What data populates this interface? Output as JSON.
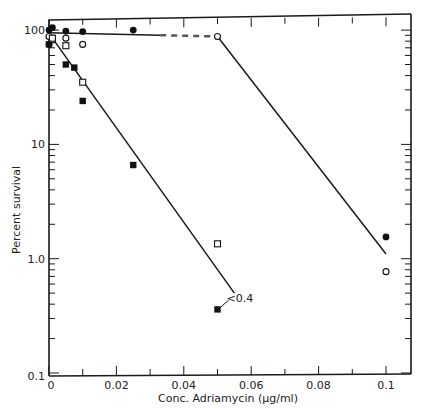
{
  "chart_data": {
    "type": "scatter",
    "title": "",
    "xlabel": "Conc. Adriamycin (μg/ml)",
    "ylabel": "Percent survival",
    "xlim": [
      0,
      0.105
    ],
    "ylim": [
      0.1,
      120
    ],
    "yscale": "log",
    "x_ticks": [
      0,
      0.02,
      0.04,
      0.06,
      0.08,
      0.1
    ],
    "x_tick_labels": [
      "0",
      "0.02",
      "0.04",
      "0.06",
      "0.08",
      "0.1"
    ],
    "y_ticks": [
      0.1,
      1.0,
      10,
      100
    ],
    "y_tick_labels": [
      "0.1",
      "1.0",
      "10",
      "100"
    ],
    "grid": false,
    "legend": null,
    "annotations": [
      {
        "text": "<0.4",
        "x": 0.05,
        "y": 0.36
      }
    ],
    "series": [
      {
        "name": "filled circles",
        "marker": "filled-circle",
        "points": [
          [
            0,
            100
          ],
          [
            0,
            75
          ],
          [
            0.001,
            105
          ],
          [
            0.005,
            98
          ],
          [
            0.01,
            97
          ],
          [
            0.025,
            100
          ],
          [
            0.1,
            1.55
          ]
        ]
      },
      {
        "name": "open circles",
        "marker": "open-circle",
        "points": [
          [
            0,
            88
          ],
          [
            0.001,
            82
          ],
          [
            0.005,
            85
          ],
          [
            0.01,
            75
          ],
          [
            0.05,
            88
          ],
          [
            0.1,
            0.77
          ]
        ]
      },
      {
        "name": "filled squares",
        "marker": "filled-square",
        "points": [
          [
            0,
            75
          ],
          [
            0.005,
            50
          ],
          [
            0.0075,
            47
          ],
          [
            0.01,
            24
          ],
          [
            0.025,
            6.6
          ],
          [
            0.05,
            0.36
          ]
        ]
      },
      {
        "name": "open squares",
        "marker": "open-square",
        "points": [
          [
            0.001,
            85
          ],
          [
            0.005,
            73
          ],
          [
            0.01,
            35
          ],
          [
            0.05,
            1.35
          ]
        ]
      }
    ],
    "fit_lines": [
      {
        "name": "circles plateau",
        "points": [
          [
            0,
            95
          ],
          [
            0.05,
            88
          ]
        ],
        "style": "solid-then-dashed"
      },
      {
        "name": "circles decline",
        "points": [
          [
            0.05,
            88
          ],
          [
            0.1,
            1.1
          ]
        ],
        "style": "solid"
      },
      {
        "name": "squares decline",
        "points": [
          [
            0.001,
            85
          ],
          [
            0.055,
            0.5
          ]
        ],
        "style": "solid"
      }
    ]
  }
}
